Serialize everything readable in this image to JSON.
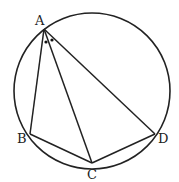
{
  "diagram": {
    "type": "circle-inscribed-quadrilateral",
    "circle": {
      "cx": 92,
      "cy": 92,
      "r": 78
    },
    "points": {
      "A": {
        "label": "A",
        "x": 44,
        "y": 29
      },
      "B": {
        "label": "B",
        "x": 30,
        "y": 134
      },
      "C": {
        "label": "C",
        "x": 92,
        "y": 163
      },
      "D": {
        "label": "D",
        "x": 155,
        "y": 134
      }
    },
    "segments": [
      "AB",
      "AC",
      "AD",
      "BC",
      "CD"
    ],
    "angle_marks": "two equal angles at A (BAC = CAD), marked with dots",
    "stroke_color": "#222222"
  }
}
